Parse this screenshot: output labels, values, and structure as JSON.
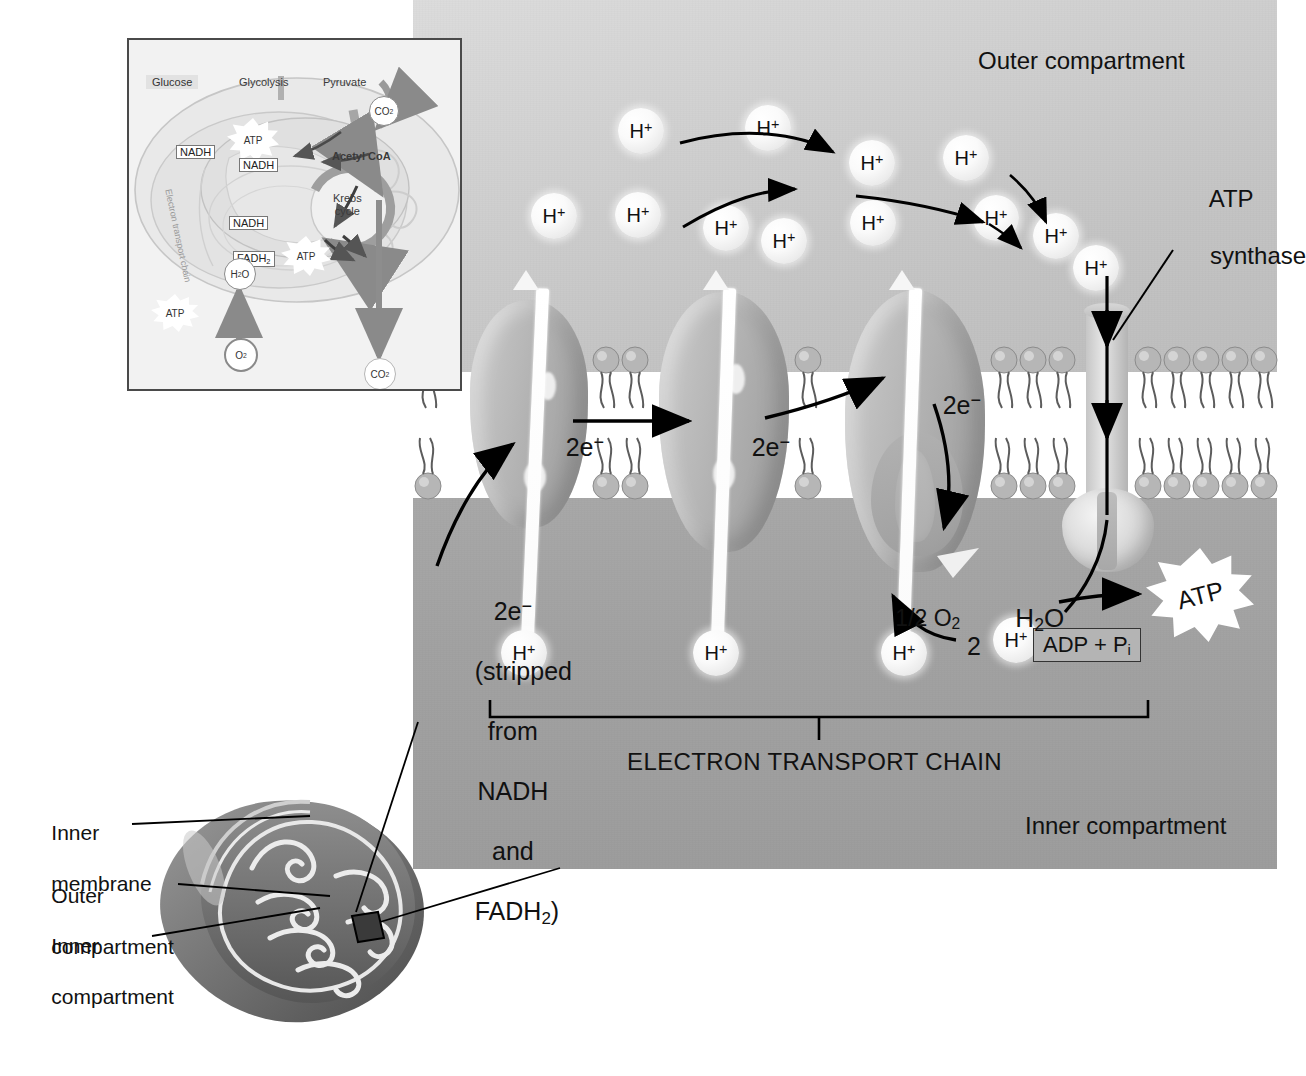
{
  "main_panel": {
    "outer_compartment_label": "Outer compartment",
    "inner_compartment_label": "Inner compartment",
    "atp_synthase_label": "ATP\nsynthase",
    "etc_label": "ELECTRON TRANSPORT CHAIN",
    "electron_label": "2e",
    "electron_charge": "−",
    "electron_source_note": "2e−\n(stripped\nfrom\nNADH\nand\nFADH2)",
    "electron_source_lines": [
      "2e",
      "(stripped",
      "from",
      "NADH",
      "and",
      "FADH",
      ")"
    ],
    "half_oxygen": "1/2 O",
    "half_oxygen_sub": "2",
    "water": "H",
    "water_sub": "2",
    "water_tail": "O",
    "two_protons_count": "2",
    "proton_label": "H",
    "proton_charge": "+",
    "adp_label": "ADP + P",
    "adp_sub": "i",
    "atp_label": "ATP",
    "proton_gradient_count_outer": 12,
    "proton_count_inner": 4,
    "electron_steps": [
      "2e−",
      "2e−",
      "2e−"
    ],
    "colors": {
      "outer_compartment": "#cfcfcf",
      "inner_compartment": "#a3a3a3",
      "membrane_interior": "#ffffff",
      "lipid_head": "#b3b3b3",
      "protein_complex": "#b6b6b6",
      "proton_sphere": "#fafafa",
      "arrow": "#000000",
      "atp_burst": "#ffffff"
    }
  },
  "inset": {
    "glucose": "Glucose",
    "glycolysis": "Glycolysis",
    "pyruvate": "Pyruvate",
    "acetyl_coa": "Acetyl CoA",
    "krebs": "Krebs\ncycle",
    "krebs_line1": "Krebs",
    "krebs_line2": "cycle",
    "nadh": "NADH",
    "fadh2": "FADH",
    "fadh2_sub": "2",
    "atp": "ATP",
    "etc_rotated": "Electron transport chain",
    "water": "H",
    "water_sub": "2",
    "water_tail": "O",
    "oxygen": "O",
    "oxygen_sub": "2",
    "co2": "CO",
    "co2_sub": "2"
  },
  "mitochondrion": {
    "labels": [
      {
        "id": "inner-membrane",
        "text": "Inner\nmembrane",
        "line1": "Inner",
        "line2": "membrane"
      },
      {
        "id": "outer-compartment",
        "text": "Outer\ncompartment",
        "line1": "Outer",
        "line2": "compartment"
      },
      {
        "id": "inner-compartment",
        "text": "Inner\ncompartment",
        "line1": "Inner",
        "line2": "compartment"
      }
    ]
  }
}
